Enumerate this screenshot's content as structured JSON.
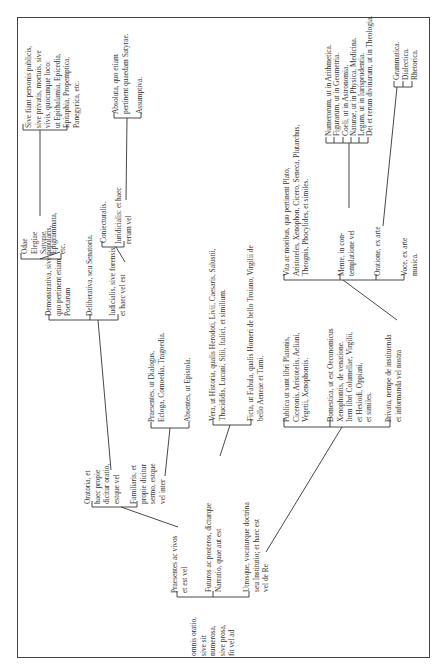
{
  "diagram": {
    "root": {
      "label": "omnis oratio,\nsive sit\nnumerosa,\nsive prosa,\nfit vel ad"
    },
    "level1": [
      {
        "id": "praesentes",
        "label": "Praesentes ac vivos\net est vel"
      },
      {
        "id": "futuros",
        "label": "Futuros ac posteros, dicturque\nNarratio, quae aut est"
      },
      {
        "id": "utrosque",
        "label": "Utrosque, vocaturque doctrina\nseu Institutio; et haec est\nvel de Re"
      }
    ],
    "praesentes_children": [
      {
        "id": "oratoria",
        "label": "Oratoria, et\nhaec propie\ndicitur oratio,\nestque vel"
      },
      {
        "id": "familiaris",
        "label": "Familiaris, et\npropie dicitur\nsermo, estque\nvel inter"
      }
    ],
    "oratoria_children": [
      {
        "id": "demonstrativa",
        "label": "Demonstrativa, sive popularis,\nquo pertinent etiam\nPoetarum"
      },
      {
        "id": "deliberativa",
        "label": "Deliberativa, seu Senatoria."
      },
      {
        "id": "iudicialis",
        "label": "Iudicialis, sive forensis,\net haec vel est"
      }
    ],
    "demonstrativa_children": [
      {
        "id": "odae",
        "label": "Odae\nElegiae\nSatyrae\nEpigrammata,\netc."
      }
    ],
    "odae_children": [
      {
        "id": "sive_fiant",
        "label": "Sive fiant personis publicis,\nsive privatis, mortuis, sive\nvivis, quocunque loco:\nut Epithalamia, Epicedia,\nEpitaphia, Propemptica,\nPanegyrica, etc."
      }
    ],
    "iudicialis_children": [
      {
        "id": "coniecturalis",
        "label": "Coniecturalis."
      },
      {
        "id": "iuridicialis",
        "label": "Iuridicialis: et haec\nrerum vel"
      }
    ],
    "iuridicialis_children": [
      {
        "id": "absoluta",
        "label": "Absoluta, quo etiam\npertinent quaedam Satyrae."
      },
      {
        "id": "assumptiva",
        "label": "Assumptiva."
      }
    ],
    "familiaris_children": [
      {
        "id": "praesentes_dialogus",
        "label": "Praesentes, ut Dialogus,\nEcloga, Comoedia, Tragoedia."
      },
      {
        "id": "absentes",
        "label": "Absentes, ut Epistola."
      }
    ],
    "narratio_children": [
      {
        "id": "vera",
        "label": "Vera, ut Historia, qualis Herodoti, Livii, Caesaris, Salustii,\nThucididis, Lucani, Silii, Italici, et similium."
      },
      {
        "id": "ficta",
        "label": "Ficta, ut Fabula, qualis Homeri de bello Troiano, Virgilii de\nbello Aeneae et Turni."
      }
    ],
    "re_children": [
      {
        "id": "publica",
        "label": "Publica ut sunt libri Platonis,\nCiceronis, Aristotelis, Aeliani,\nVegetii, Xenophontis."
      },
      {
        "id": "domestica",
        "label": "Domestica, ut est Oeconomicus\nXenophontis, de venatione.\nItem libri Columellae, Virgilii,\net Hesiodi, Oppiani,\net similes."
      },
      {
        "id": "privata",
        "label": "Privata, nempe de instituenda\net informanda vel nostra"
      }
    ],
    "privata_children": [
      {
        "id": "vita",
        "label": "Vita ac moribus, quo pertinent Plato,\nAristoteles, Xenophon, Cicero, Seneca, Plutarchus,\nTheognis, Phocylides, et similes."
      },
      {
        "id": "mente",
        "label": "Mente, in con-\ntemplatione vel"
      },
      {
        "id": "oratione",
        "label": "Oratione, ex arte"
      },
      {
        "id": "voce",
        "label": "Voce, ex arte\nmusica."
      }
    ],
    "mente_children": [
      {
        "id": "numerorum",
        "label": "Numerorum, ut in Arithmetica."
      },
      {
        "id": "figurarum",
        "label": "Figurarum, ut in Geometria."
      },
      {
        "id": "coeli",
        "label": "Coeli, ut in Astronomia."
      },
      {
        "id": "naturae",
        "label": "Naturae, ut in Physica, Medicina."
      },
      {
        "id": "legum",
        "label": "Legum, ut in Iurisprudentia."
      },
      {
        "id": "dei",
        "label": "Dei et rerum divinarum, ut in Theologia."
      }
    ],
    "oratione_children": [
      {
        "id": "grammatica",
        "label": "Grammatica."
      },
      {
        "id": "dialectica",
        "label": "Dialectica."
      },
      {
        "id": "rhetorica",
        "label": "Rhetorica."
      }
    ]
  },
  "style": {
    "line_color": "#333333",
    "frame_color": "#444444"
  }
}
